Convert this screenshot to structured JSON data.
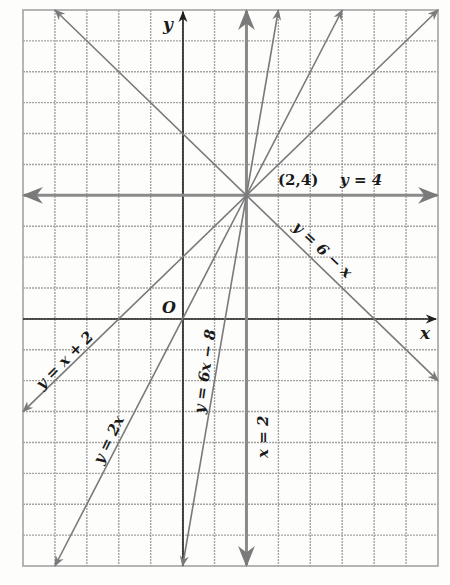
{
  "figure": {
    "grid": {
      "x_min": -5,
      "x_max": 8,
      "y_min": -8,
      "y_max": 10,
      "color": "#9a9a9a",
      "background": "#fdfdfc"
    },
    "axes": {
      "x_label": "x",
      "y_label": "y",
      "origin_label": "O",
      "color": "#1e1e1e"
    },
    "point": {
      "label": "(2,4)",
      "x": 2,
      "y": 4
    },
    "lines": [
      {
        "id": "y-eq-4",
        "label": "y = 4",
        "kind": "horizontal",
        "y": 4,
        "color": "#8a8a8a"
      },
      {
        "id": "x-eq-2",
        "label": "x = 2",
        "kind": "vertical",
        "x": 2,
        "color": "#8a8a8a"
      },
      {
        "id": "y-eq-6-minus-x",
        "label": "y = 6 − x",
        "slope": -1,
        "intercept": 6,
        "color": "#7a7a7a"
      },
      {
        "id": "y-eq-x-plus-2",
        "label": "y = x + 2",
        "slope": 1,
        "intercept": 2,
        "color": "#7a7a7a"
      },
      {
        "id": "y-eq-2x",
        "label": "y = 2x",
        "slope": 2,
        "intercept": 0,
        "color": "#7a7a7a"
      },
      {
        "id": "y-eq-6x-minus-8",
        "label": "y = 6x − 8",
        "slope": 6,
        "intercept": -8,
        "color": "#7a7a7a"
      }
    ]
  },
  "labels": {
    "y_axis": "y",
    "x_axis": "x",
    "origin": "O",
    "point": "(2,4)",
    "line_y4": "y = 4",
    "line_6mx": "y = 6 − x",
    "line_xp2": "y = x + 2",
    "line_2x": "y = 2x",
    "line_6xm8": "y = 6x − 8",
    "line_x2": "x = 2"
  }
}
